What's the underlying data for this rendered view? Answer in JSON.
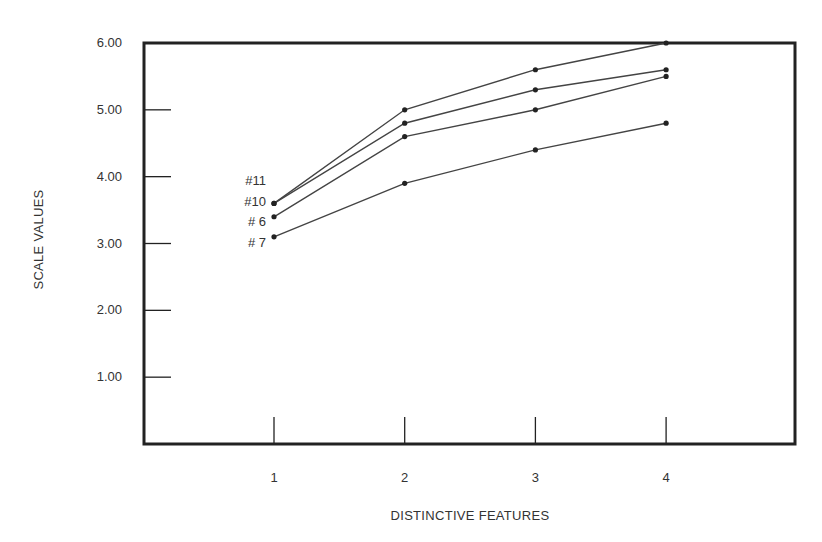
{
  "chart_data": {
    "type": "line",
    "title": "",
    "xlabel": "DISTINCTIVE FEATURES",
    "ylabel": "SCALE VALUES",
    "x": [
      1,
      2,
      3,
      4
    ],
    "x_tick_labels": [
      "1",
      "2",
      "3",
      "4"
    ],
    "y_tick_labels": [
      "6.00",
      "5.00",
      "4.00",
      "3.00",
      "2.00",
      "1.00"
    ],
    "y_ticks": [
      6,
      5,
      4,
      3,
      2,
      1
    ],
    "ylim": [
      0,
      6
    ],
    "xlim": [
      0,
      5
    ],
    "grid": false,
    "legend_position": "inline-left-of-first-point",
    "series": [
      {
        "name": "#11",
        "values": [
          3.6,
          5.0,
          5.6,
          6.0
        ]
      },
      {
        "name": "#10",
        "values": [
          3.6,
          4.8,
          5.3,
          5.6
        ]
      },
      {
        "name": "#6",
        "values": [
          3.4,
          4.6,
          5.0,
          5.5
        ]
      },
      {
        "name": "#7",
        "values": [
          3.1,
          3.9,
          4.4,
          4.8
        ]
      }
    ]
  },
  "series_labels": [
    "#11",
    "#10",
    "# 6",
    "# 7"
  ],
  "colors": {
    "line": "#444444",
    "axis": "#222222",
    "text": "#333333"
  }
}
